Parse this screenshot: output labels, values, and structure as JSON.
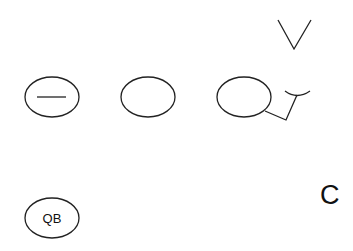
{
  "diagram": {
    "type": "football-play-diagram",
    "stroke_color": "#222222",
    "background": "#ffffff",
    "players": [
      {
        "id": "lineman-center",
        "shape": "oval",
        "marker": "horizontal-line",
        "label": "",
        "cx": 52,
        "cy": 97,
        "rx": 27,
        "ry": 20
      },
      {
        "id": "lineman-guard",
        "shape": "oval",
        "marker": "none",
        "label": "",
        "cx": 148,
        "cy": 97,
        "rx": 27,
        "ry": 20
      },
      {
        "id": "lineman-tackle",
        "shape": "oval",
        "marker": "block-route",
        "label": "",
        "cx": 244,
        "cy": 97,
        "rx": 27,
        "ry": 20
      },
      {
        "id": "quarterback",
        "shape": "oval",
        "marker": "text",
        "label": "QB",
        "cx": 52,
        "cy": 218,
        "rx": 27,
        "ry": 20
      }
    ],
    "defenders": [
      {
        "id": "defender-v",
        "symbol": "V",
        "points": "278,20 294,49 311,20"
      },
      {
        "id": "defender-c",
        "symbol": "C",
        "label": "C",
        "x": 320,
        "y": 204
      }
    ],
    "routes": [
      {
        "id": "tackle-block-route",
        "from": "lineman-tackle",
        "points": "265,111 286,120 297,95",
        "end": "block-cap"
      }
    ]
  }
}
